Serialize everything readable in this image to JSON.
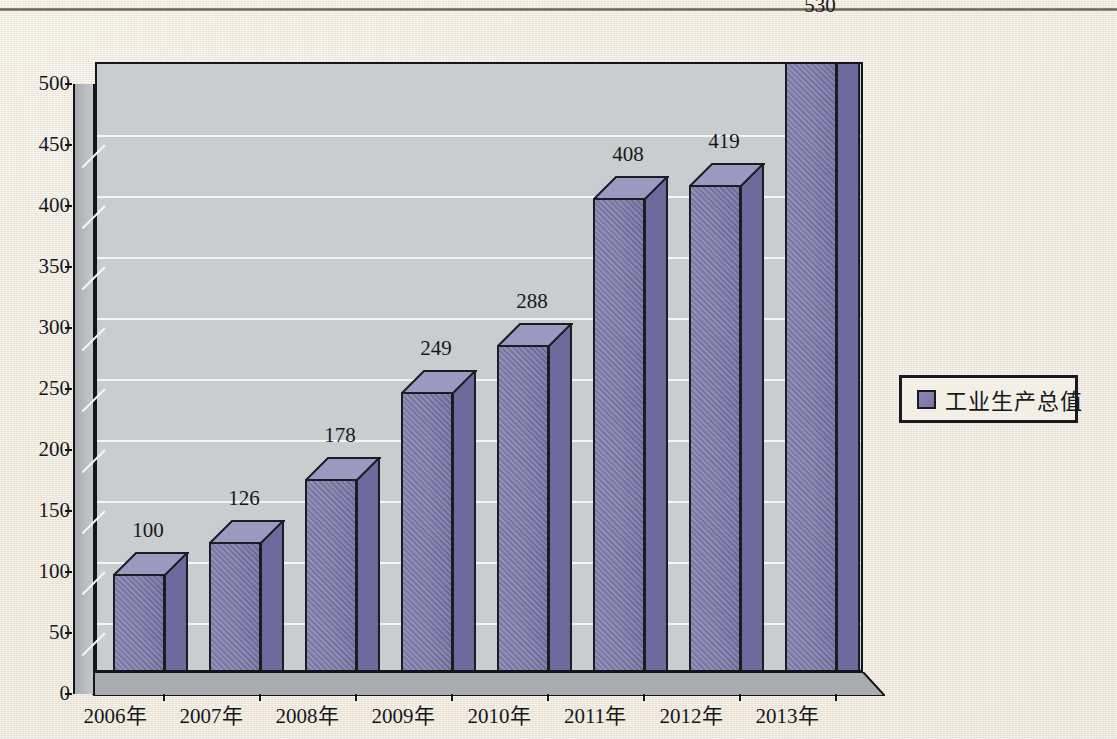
{
  "chart_data": {
    "type": "bar",
    "title": "",
    "xlabel": "",
    "ylabel": "",
    "categories": [
      "2006年",
      "2007年",
      "2008年",
      "2009年",
      "2010年",
      "2011年",
      "2012年",
      "2013年"
    ],
    "values": [
      100,
      126,
      178,
      249,
      288,
      408,
      419,
      530
    ],
    "series": [
      {
        "name": "工业生产总值",
        "values": [
          100,
          126,
          178,
          249,
          288,
          408,
          419,
          530
        ]
      }
    ],
    "data_labels": [
      "100",
      "126",
      "178",
      "249",
      "288",
      "408",
      "419",
      "530"
    ],
    "ylim": [
      0,
      500
    ],
    "y_ticks": [
      0,
      50,
      100,
      150,
      200,
      250,
      300,
      350,
      400,
      450,
      500
    ],
    "y_tick_labels": [
      "0",
      "50",
      "100",
      "150",
      "200",
      "250",
      "300",
      "350",
      "400",
      "450",
      "500"
    ],
    "grid": true,
    "grid_axis": "y",
    "legend": {
      "position": "right",
      "entries": [
        "工业生产总值"
      ]
    },
    "style": "3d-column",
    "colors": {
      "bar_front": "#7d78a6",
      "bar_top": "#9c98c0",
      "bar_side": "#6a6596",
      "bar_outline": "#1b1c24",
      "plot_background": "#c9cdcf",
      "gridline": "#f4f6f7",
      "page_background": "#f2ece1",
      "axis": "#15161a",
      "text": "#17181c"
    }
  },
  "legend": {
    "label": "工业生产总值"
  },
  "axis": {
    "y_labels": [
      "500",
      "450",
      "400",
      "350",
      "300",
      "250",
      "200",
      "150",
      "100",
      "50",
      "0"
    ],
    "x_labels": [
      "2006年",
      "2007年",
      "2008年",
      "2009年",
      "2010年",
      "2011年",
      "2012年",
      "2013年"
    ]
  },
  "bar_labels": [
    "100",
    "126",
    "178",
    "249",
    "288",
    "408",
    "419",
    "530"
  ]
}
